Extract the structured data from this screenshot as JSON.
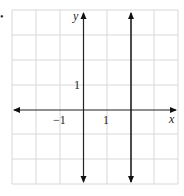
{
  "figure": {
    "marker": "•",
    "axes": {
      "x_label": "x",
      "y_label": "y",
      "x_range": [
        -3,
        4
      ],
      "y_range": [
        -3,
        4
      ],
      "tick_labels": {
        "x_neg": "−1",
        "x_pos": "1",
        "y_pos": "1"
      }
    },
    "grid": {
      "columns": 7,
      "rows": 7,
      "step": 1,
      "color": "#d8d8d8"
    },
    "lines": [
      {
        "type": "vertical",
        "equation": "x = 2",
        "color": "#111111"
      }
    ],
    "axis_color": "#222222"
  }
}
